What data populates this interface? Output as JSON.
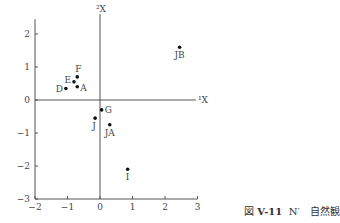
{
  "chart_data": {
    "type": "scatter",
    "title": "",
    "xlabel": "¹X",
    "ylabel": "²X",
    "xlim": [
      -2,
      3
    ],
    "ylim": [
      -3,
      2.3
    ],
    "x_ticks": [
      "−2",
      "−1",
      "0",
      "1",
      "2",
      "3"
    ],
    "y_ticks": [
      "2",
      "1",
      "0",
      "−1",
      "−2",
      "−3"
    ],
    "grid": false,
    "points": [
      {
        "label": "F",
        "x": -0.7,
        "y": 0.7
      },
      {
        "label": "E",
        "x": -0.8,
        "y": 0.55
      },
      {
        "label": "A",
        "x": -0.7,
        "y": 0.4
      },
      {
        "label": "D",
        "x": -1.05,
        "y": 0.35
      },
      {
        "label": "G",
        "x": 0.05,
        "y": -0.3
      },
      {
        "label": "J",
        "x": -0.15,
        "y": -0.55
      },
      {
        "label": "JA",
        "x": 0.3,
        "y": -0.75
      },
      {
        "label": "I",
        "x": 0.85,
        "y": -2.1
      },
      {
        "label": "JB",
        "x": 2.45,
        "y": 1.6
      }
    ]
  },
  "caption": {
    "figure_prefix": "図",
    "figure_number": "V-11",
    "title": "N′　自然観"
  }
}
